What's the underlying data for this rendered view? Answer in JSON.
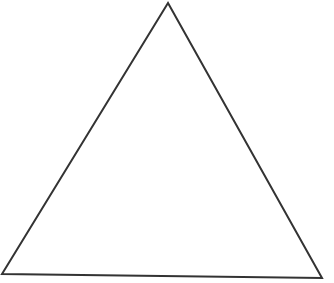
{
  "diagram": {
    "shape": "triangle",
    "stroke_color": "#333333",
    "fill_color": "none",
    "stroke_width": 2,
    "vertices": [
      {
        "name": "apex",
        "x": 168,
        "y": 3
      },
      {
        "name": "bottom-left",
        "x": 2,
        "y": 274
      },
      {
        "name": "bottom-right",
        "x": 322,
        "y": 278
      }
    ]
  }
}
